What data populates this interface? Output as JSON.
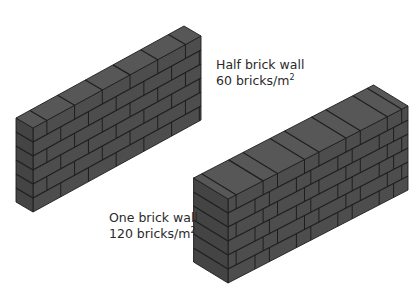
{
  "diagram": {
    "type": "isometric brick wall comparison",
    "colors": {
      "background": "#ffffff",
      "brick_face": "#4d4d4d",
      "brick_top": "#575757",
      "brick_side": "#444444",
      "mortar": "#1e1e1e",
      "text": "#2a2a2a"
    },
    "walls": [
      {
        "id": "half-brick-wall",
        "name": "Half brick wall",
        "density_value": "60 bricks/m",
        "density_exp": "2",
        "courses": 6,
        "bond": "stretcher"
      },
      {
        "id": "one-brick-wall",
        "name": "One brick wall",
        "density_value": "120 bricks/m",
        "density_exp": "2",
        "courses": 6,
        "bond": "header/stretcher"
      }
    ]
  }
}
